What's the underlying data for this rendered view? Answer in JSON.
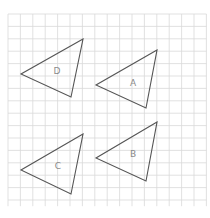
{
  "diagram": {
    "type": "grid-with-triangles",
    "grid": {
      "x0": 8,
      "y0": 14,
      "cell": 12.4,
      "cols": 16,
      "rows": 15.5,
      "line_color": "#d9d9d9"
    },
    "stroke_color": "#555555",
    "label_color": "#8a8a8a",
    "triangles": [
      {
        "label": "D",
        "points": [
          [
            83,
            39
          ],
          [
            21,
            74
          ],
          [
            71,
            97
          ]
        ],
        "label_pos": [
          57,
          71
        ]
      },
      {
        "label": "A",
        "points": [
          [
            157,
            50
          ],
          [
            96,
            85
          ],
          [
            146,
            108
          ]
        ],
        "label_pos": [
          133,
          83
        ]
      },
      {
        "label": "C",
        "points": [
          [
            83,
            134
          ],
          [
            21,
            170
          ],
          [
            71,
            194
          ]
        ],
        "label_pos": [
          58,
          166
        ]
      },
      {
        "label": "B",
        "points": [
          [
            157,
            122
          ],
          [
            96,
            158
          ],
          [
            146,
            181
          ]
        ],
        "label_pos": [
          133,
          154
        ]
      }
    ]
  }
}
